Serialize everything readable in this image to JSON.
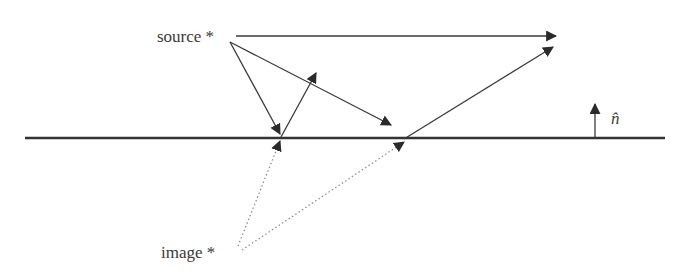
{
  "diagram": {
    "labels": {
      "source": "source *",
      "image": "image *",
      "normal": "n̂"
    },
    "colors": {
      "ink": "#3a3a3a",
      "surface": "#333333",
      "dotted": "#888888",
      "background": "#ffffff"
    },
    "elements": [
      {
        "id": "direct-ray",
        "type": "arrow",
        "from": [
          236,
          36
        ],
        "to": [
          556,
          36
        ],
        "style": "solid"
      },
      {
        "id": "incident-ray-1",
        "type": "arrow",
        "from": [
          230,
          42
        ],
        "to": [
          280,
          134
        ],
        "style": "solid"
      },
      {
        "id": "reflected-ray-1",
        "type": "arrow",
        "from": [
          281,
          137
        ],
        "to": [
          316,
          73
        ],
        "style": "solid"
      },
      {
        "id": "incident-ray-2",
        "type": "arrow",
        "from": [
          230,
          42
        ],
        "to": [
          391,
          125
        ],
        "style": "solid"
      },
      {
        "id": "reflected-ray-2",
        "type": "arrow",
        "from": [
          404,
          139
        ],
        "to": [
          553,
          47
        ],
        "style": "solid"
      },
      {
        "id": "surface",
        "type": "line",
        "from": [
          25,
          138
        ],
        "to": [
          665,
          138
        ],
        "style": "solid-thick"
      },
      {
        "id": "normal-vector",
        "type": "arrow",
        "from": [
          595,
          138
        ],
        "to": [
          595,
          104
        ],
        "style": "solid"
      },
      {
        "id": "image-ray-1",
        "type": "arrow",
        "from": [
          238,
          246
        ],
        "to": [
          280,
          141
        ],
        "style": "dotted"
      },
      {
        "id": "image-ray-2",
        "type": "arrow",
        "from": [
          242,
          250
        ],
        "to": [
          404,
          142
        ],
        "style": "dotted"
      }
    ]
  }
}
